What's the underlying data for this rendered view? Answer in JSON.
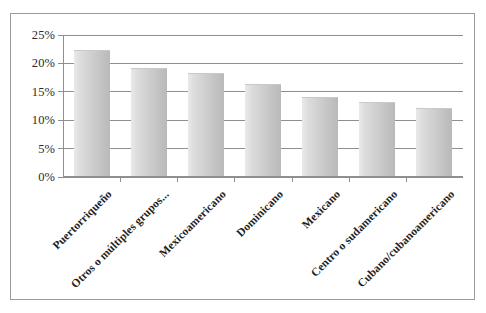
{
  "chart_data": {
    "type": "bar",
    "title": "",
    "subtitle": "",
    "xlabel": "",
    "ylabel": "",
    "categories": [
      "Puertorriqueño",
      "Otros o múltiples grupos...",
      "Mexicoamericano",
      "Dominicano",
      "Mexicano",
      "Centro o sudamericano",
      "Cubano/cubanoamericano"
    ],
    "values": [
      22.0,
      18.8,
      18.0,
      16.0,
      13.8,
      12.8,
      11.8
    ],
    "value_labels": [
      "22%",
      "18.8%",
      "18%",
      "16%",
      "13.8%",
      "12.8%",
      "11.8%"
    ],
    "ylim": [
      0,
      25
    ],
    "ytick_labels": [
      "0%",
      "5%",
      "10%",
      "15%",
      "20%",
      "25%"
    ],
    "ytick_values": [
      0,
      5,
      10,
      15,
      20,
      25
    ],
    "grid": true,
    "legend": false,
    "legend_position": "none",
    "bar_color": "#cfcfcf",
    "grid_color": "#8f8f8f",
    "border_color": "#9a9a9a",
    "background_color": "#ffffff",
    "text_color": "#1f1f1f"
  }
}
